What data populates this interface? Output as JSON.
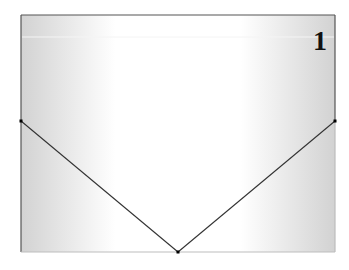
{
  "diagram": {
    "type": "figure-panel",
    "panel_label": "1",
    "shape": "rectangle-with-v-fold",
    "fill_gradient": {
      "edge_color": "#d2d2d2",
      "center_color": "#ffffff"
    },
    "colors": {
      "frame_dark": "#555555",
      "frame_light": "#bdbdbd",
      "fold_line": "#333333",
      "vertex": "#000000"
    },
    "vertices": [
      {
        "name": "left-mid",
        "description": "left side, vertex of fold"
      },
      {
        "name": "right-mid",
        "description": "right side, vertex of fold"
      },
      {
        "name": "bottom-center",
        "description": "bottom edge, apex of fold"
      }
    ]
  }
}
